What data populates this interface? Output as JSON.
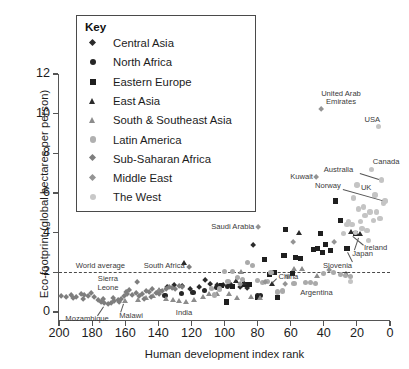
{
  "chart_data": {
    "type": "scatter",
    "title": "",
    "xlabel": "Human development index rank",
    "ylabel": "Eco-footprint (global hectares per person)",
    "xlim": [
      200,
      0
    ],
    "xticks": [
      200,
      180,
      160,
      140,
      120,
      100,
      80,
      60,
      40,
      20,
      0
    ],
    "ylim": [
      0,
      12
    ],
    "yticks": [
      0,
      2,
      4,
      6,
      8,
      10,
      12
    ],
    "x_axis_reversed": true,
    "grid": false,
    "legend_position": "top-left-inset",
    "legend_title": "Key",
    "reference_lines": [
      {
        "label": "World average",
        "axis": "y",
        "value": 2.0,
        "style": "dashed"
      }
    ],
    "series": [
      {
        "name": "Central Asia",
        "marker": "diamond",
        "color": "#2b2b2b",
        "size": 5.4,
        "points": [
          {
            "x": 111,
            "y": 1.55
          },
          {
            "x": 115,
            "y": 1.2
          },
          {
            "x": 108,
            "y": 1.35
          },
          {
            "x": 104,
            "y": 1.3
          },
          {
            "x": 100,
            "y": 1.3
          },
          {
            "x": 96,
            "y": 1.35
          },
          {
            "x": 90,
            "y": 1.2
          },
          {
            "x": 86,
            "y": 1.15
          },
          {
            "x": 82,
            "y": 3.3
          },
          {
            "x": 120,
            "y": 1.1
          },
          {
            "x": 125,
            "y": 1.25
          },
          {
            "x": 130,
            "y": 1.3
          },
          {
            "x": 134,
            "y": 1.2
          },
          {
            "x": 139,
            "y": 1.0
          }
        ]
      },
      {
        "name": "North Africa",
        "marker": "circle",
        "color": "#262626",
        "size": 5.2,
        "points": [
          {
            "x": 136,
            "y": 0.85
          },
          {
            "x": 126,
            "y": 0.95
          },
          {
            "x": 119,
            "y": 1.0
          },
          {
            "x": 112,
            "y": 1.1
          },
          {
            "x": 105,
            "y": 1.25
          },
          {
            "x": 98,
            "y": 1.3
          },
          {
            "x": 78,
            "y": 0.85
          },
          {
            "x": 80,
            "y": 0.85
          }
        ]
      },
      {
        "name": "Eastern Europe",
        "marker": "square",
        "color": "#1f1f1f",
        "size": 5.2,
        "points": [
          {
            "x": 102,
            "y": 1.35
          },
          {
            "x": 99,
            "y": 0.5
          },
          {
            "x": 95,
            "y": 1.3
          },
          {
            "x": 76,
            "y": 2.65
          },
          {
            "x": 73,
            "y": 1.9
          },
          {
            "x": 70,
            "y": 2.0
          },
          {
            "x": 68,
            "y": 0.75
          },
          {
            "x": 64,
            "y": 2.85
          },
          {
            "x": 63,
            "y": 4.15
          },
          {
            "x": 59,
            "y": 1.95
          },
          {
            "x": 57,
            "y": 2.75
          },
          {
            "x": 54,
            "y": 2.7
          },
          {
            "x": 46,
            "y": 3.15
          },
          {
            "x": 44,
            "y": 3.2
          },
          {
            "x": 42,
            "y": 3.95
          },
          {
            "x": 41,
            "y": 3.0
          },
          {
            "x": 39,
            "y": 3.4
          },
          {
            "x": 36,
            "y": 3.1
          },
          {
            "x": 33,
            "y": 5.6
          },
          {
            "x": 30,
            "y": 4.6
          },
          {
            "x": 26,
            "y": 3.2
          },
          {
            "x": 88,
            "y": 1.4
          },
          {
            "x": 85,
            "y": 1.4
          },
          {
            "x": 80,
            "y": 0.75
          },
          {
            "x": 21,
            "y": 3.95
          }
        ]
      },
      {
        "name": "East Asia",
        "marker": "triangle",
        "color": "#2b2b2b",
        "size": 5.6,
        "points": [
          {
            "x": 124,
            "y": 2.5
          },
          {
            "x": 93,
            "y": 1.55
          },
          {
            "x": 88,
            "y": 1.45
          },
          {
            "x": 71,
            "y": 1.4
          },
          {
            "x": 55,
            "y": 4.0
          },
          {
            "x": 23,
            "y": 4.05
          },
          {
            "x": 18,
            "y": 3.95
          },
          {
            "x": 26,
            "y": 1.95
          }
        ]
      },
      {
        "name": "South & Southeast Asia",
        "marker": "triangle",
        "color": "#8c8c8c",
        "size": 5.6,
        "points": [
          {
            "x": 160,
            "y": 0.55
          },
          {
            "x": 152,
            "y": 0.6
          },
          {
            "x": 147,
            "y": 0.7
          },
          {
            "x": 143,
            "y": 0.8
          },
          {
            "x": 139,
            "y": 1.1
          },
          {
            "x": 135,
            "y": 0.65
          },
          {
            "x": 131,
            "y": 0.6
          },
          {
            "x": 127,
            "y": 0.55
          },
          {
            "x": 123,
            "y": 0.5
          },
          {
            "x": 118,
            "y": 0.6
          },
          {
            "x": 113,
            "y": 0.75
          },
          {
            "x": 109,
            "y": 0.9
          },
          {
            "x": 104,
            "y": 0.9
          },
          {
            "x": 97,
            "y": 0.9
          },
          {
            "x": 92,
            "y": 0.7
          },
          {
            "x": 84,
            "y": 0.75
          },
          {
            "x": 78,
            "y": 0.7
          },
          {
            "x": 58,
            "y": 2.2
          },
          {
            "x": 53,
            "y": 2.2
          },
          {
            "x": 90,
            "y": 2.05
          },
          {
            "x": 44,
            "y": 1.85
          }
        ]
      },
      {
        "name": "Latin America",
        "marker": "circle",
        "color": "#aaaaaa",
        "size": 5.4,
        "points": [
          {
            "x": 108,
            "y": 1.2
          },
          {
            "x": 103,
            "y": 1.15
          },
          {
            "x": 98,
            "y": 1.55
          },
          {
            "x": 95,
            "y": 2.05
          },
          {
            "x": 92,
            "y": 1.75
          },
          {
            "x": 89,
            "y": 1.65
          },
          {
            "x": 86,
            "y": 2.5
          },
          {
            "x": 83,
            "y": 2.35
          },
          {
            "x": 80,
            "y": 1.6
          },
          {
            "x": 77,
            "y": 1.5
          },
          {
            "x": 74,
            "y": 1.55
          },
          {
            "x": 72,
            "y": 2.0
          },
          {
            "x": 68,
            "y": 1.0
          },
          {
            "x": 65,
            "y": 1.05
          },
          {
            "x": 62,
            "y": 1.8
          },
          {
            "x": 58,
            "y": 1.45
          },
          {
            "x": 51,
            "y": 1.5
          },
          {
            "x": 48,
            "y": 1.5
          },
          {
            "x": 45,
            "y": 1.45
          },
          {
            "x": 40,
            "y": 1.95
          },
          {
            "x": 34,
            "y": 2.0
          },
          {
            "x": 30,
            "y": 1.9
          },
          {
            "x": 27,
            "y": 1.85
          },
          {
            "x": 24,
            "y": 1.8
          },
          {
            "x": 100,
            "y": 2.05
          },
          {
            "x": 106,
            "y": 0.85
          }
        ]
      },
      {
        "name": "Sub-Saharan Africa",
        "marker": "diamond",
        "color": "#7e7e7e",
        "size": 5.4,
        "points": [
          {
            "x": 198,
            "y": 0.75
          },
          {
            "x": 195,
            "y": 0.7
          },
          {
            "x": 192,
            "y": 0.8
          },
          {
            "x": 189,
            "y": 0.7
          },
          {
            "x": 186,
            "y": 0.85
          },
          {
            "x": 184,
            "y": 0.8
          },
          {
            "x": 182,
            "y": 0.75
          },
          {
            "x": 180,
            "y": 0.9
          },
          {
            "x": 178,
            "y": 0.7
          },
          {
            "x": 176,
            "y": 0.55
          },
          {
            "x": 174,
            "y": 0.45
          },
          {
            "x": 172,
            "y": 0.4
          },
          {
            "x": 170,
            "y": 0.35
          },
          {
            "x": 168,
            "y": 0.4
          },
          {
            "x": 166,
            "y": 0.5
          },
          {
            "x": 164,
            "y": 0.55
          },
          {
            "x": 162,
            "y": 0.6
          },
          {
            "x": 160,
            "y": 0.75
          },
          {
            "x": 158,
            "y": 0.85
          },
          {
            "x": 157,
            "y": 1.05
          },
          {
            "x": 155,
            "y": 0.8
          },
          {
            "x": 153,
            "y": 0.9
          },
          {
            "x": 151,
            "y": 0.75
          },
          {
            "x": 149,
            "y": 0.85
          },
          {
            "x": 147,
            "y": 1.0
          },
          {
            "x": 145,
            "y": 0.95
          },
          {
            "x": 143,
            "y": 1.1
          },
          {
            "x": 152,
            "y": 1.45
          },
          {
            "x": 141,
            "y": 0.9
          },
          {
            "x": 139,
            "y": 0.85
          },
          {
            "x": 137,
            "y": 1.0
          },
          {
            "x": 135,
            "y": 1.1
          },
          {
            "x": 133,
            "y": 1.2
          },
          {
            "x": 131,
            "y": 1.15
          },
          {
            "x": 129,
            "y": 1.1
          },
          {
            "x": 127,
            "y": 1.25
          },
          {
            "x": 125,
            "y": 1.2
          },
          {
            "x": 121,
            "y": 2.2
          },
          {
            "x": 185,
            "y": 0.6
          },
          {
            "x": 191,
            "y": 0.65
          },
          {
            "x": 173,
            "y": 0.6
          },
          {
            "x": 167,
            "y": 0.65
          },
          {
            "x": 163,
            "y": 0.45
          },
          {
            "x": 159,
            "y": 0.95
          },
          {
            "x": 148,
            "y": 0.6
          },
          {
            "x": 144,
            "y": 0.7
          }
        ]
      },
      {
        "name": "Middle East",
        "marker": "diamond",
        "color": "#949494",
        "size": 5.4,
        "points": [
          {
            "x": 79,
            "y": 4.25
          },
          {
            "x": 63,
            "y": 1.35
          },
          {
            "x": 75,
            "y": 1.45
          },
          {
            "x": 58,
            "y": 3.5
          },
          {
            "x": 44,
            "y": 6.75
          },
          {
            "x": 41,
            "y": 10.2
          },
          {
            "x": 90,
            "y": 1.35
          },
          {
            "x": 33,
            "y": 3.5
          },
          {
            "x": 36,
            "y": 2.05
          }
        ]
      },
      {
        "name": "The West",
        "marker": "circle",
        "color": "#c4c4c4",
        "size": 5.4,
        "points": [
          {
            "x": 25,
            "y": 4.55
          },
          {
            "x": 23,
            "y": 4.4
          },
          {
            "x": 22,
            "y": 5.75
          },
          {
            "x": 21,
            "y": 4.0
          },
          {
            "x": 20,
            "y": 6.4
          },
          {
            "x": 19,
            "y": 5.2
          },
          {
            "x": 18,
            "y": 4.55
          },
          {
            "x": 17,
            "y": 4.2
          },
          {
            "x": 16,
            "y": 5.3
          },
          {
            "x": 15,
            "y": 4.85
          },
          {
            "x": 14,
            "y": 4.1
          },
          {
            "x": 13,
            "y": 3.6
          },
          {
            "x": 12,
            "y": 5.05
          },
          {
            "x": 11,
            "y": 7.2
          },
          {
            "x": 10,
            "y": 4.6
          },
          {
            "x": 9,
            "y": 5.9
          },
          {
            "x": 8,
            "y": 5.05
          },
          {
            "x": 7,
            "y": 9.35
          },
          {
            "x": 6,
            "y": 4.7
          },
          {
            "x": 5,
            "y": 6.65
          },
          {
            "x": 4,
            "y": 5.5
          },
          {
            "x": 3,
            "y": 5.6
          },
          {
            "x": 26,
            "y": 4.4
          },
          {
            "x": 28,
            "y": 3.95
          },
          {
            "x": 24,
            "y": 1.55
          }
        ]
      }
    ],
    "annotations": [
      {
        "label": "United Arab\nEmirates",
        "x": 41,
        "y": 10.2,
        "place": "above"
      },
      {
        "label": "USA",
        "x": 7,
        "y": 9.35,
        "place": "above"
      },
      {
        "label": "Canada",
        "x": 11,
        "y": 7.2,
        "place": "above"
      },
      {
        "label": "Australia",
        "x": 5,
        "y": 6.65,
        "place": "left-leader"
      },
      {
        "label": "Norway",
        "x": 3,
        "y": 5.6,
        "place": "left-leader"
      },
      {
        "label": "Kuwait",
        "x": 44,
        "y": 6.75,
        "place": "left"
      },
      {
        "label": "UK",
        "x": 20,
        "y": 6.4,
        "place": "right"
      },
      {
        "label": "Saudi Arabia",
        "x": 79,
        "y": 4.25,
        "place": "left"
      },
      {
        "label": "South Africa",
        "x": 121,
        "y": 2.2,
        "place": "left"
      },
      {
        "label": "China",
        "x": 71,
        "y": 1.4,
        "place": "right-leader"
      },
      {
        "label": "Slovenia",
        "x": 26,
        "y": 3.2,
        "place": "below-leader"
      },
      {
        "label": "Japan",
        "x": 18,
        "y": 3.95,
        "place": "below-leader"
      },
      {
        "label": "Ireland",
        "x": 23,
        "y": 4.05,
        "place": "below-leader"
      },
      {
        "label": "Argentina",
        "x": 24,
        "y": 1.55,
        "place": "below"
      },
      {
        "label": "World average",
        "x": 185,
        "y": 2.0,
        "place": "above-line"
      },
      {
        "label": "Sierra\nLeone",
        "x": 178,
        "y": 0.9,
        "place": "above"
      },
      {
        "label": "Mozambique",
        "x": 172,
        "y": 0.35,
        "place": "below-leader"
      },
      {
        "label": "Malawi",
        "x": 160,
        "y": 0.5,
        "place": "below-leader"
      },
      {
        "label": "India",
        "x": 127,
        "y": 0.55,
        "place": "below"
      }
    ]
  },
  "legend": {
    "title": "Key",
    "items": [
      {
        "label": "Central Asia",
        "marker": "diamond",
        "color": "#2b2b2b"
      },
      {
        "label": "North Africa",
        "marker": "circle",
        "color": "#262626"
      },
      {
        "label": "Eastern Europe",
        "marker": "square",
        "color": "#1f1f1f"
      },
      {
        "label": "East Asia",
        "marker": "triangle",
        "color": "#2b2b2b"
      },
      {
        "label": "South & Southeast Asia",
        "marker": "triangle",
        "color": "#8c8c8c"
      },
      {
        "label": "Latin America",
        "marker": "circle",
        "color": "#b0b0b0"
      },
      {
        "label": "Sub-Saharan Africa",
        "marker": "diamond",
        "color": "#7e7e7e"
      },
      {
        "label": "Middle East",
        "marker": "diamond",
        "color": "#949494"
      },
      {
        "label": "The West",
        "marker": "circle",
        "color": "#c8c8c8"
      }
    ]
  },
  "axes": {
    "y_title": "Eco-footprint (global hectares per person)",
    "x_title": "Human development index rank",
    "y_ticks": [
      "0",
      "2",
      "4",
      "6",
      "8",
      "10",
      "12"
    ],
    "x_ticks": [
      "200",
      "180",
      "160",
      "140",
      "120",
      "100",
      "80",
      "60",
      "40",
      "20",
      "0"
    ]
  }
}
